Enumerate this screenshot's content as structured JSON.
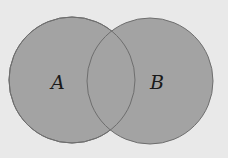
{
  "diagram": {
    "type": "venn",
    "sets": [
      {
        "label": "A",
        "cx": 72,
        "cy": 80,
        "r": 63
      },
      {
        "label": "B",
        "cx": 150,
        "cy": 81,
        "r": 63
      }
    ],
    "colors": {
      "background": "#e9e9e9",
      "fill": "#a3a3a3",
      "stroke": "#6e6e6e"
    }
  }
}
